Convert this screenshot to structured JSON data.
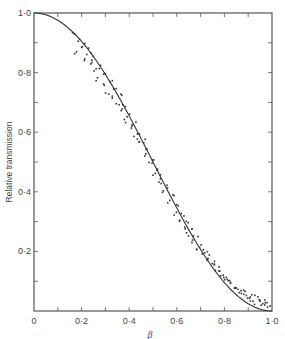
{
  "chart_data": {
    "type": "scatter",
    "title": "",
    "xlabel": "β",
    "ylabel": "Relative transmission",
    "xlim": [
      0,
      1.0
    ],
    "ylim": [
      0,
      1.0
    ],
    "grid": false,
    "legend": null,
    "x_ticks": [
      "0",
      "0·2",
      "0·4",
      "0·6",
      "0·8",
      "1·0"
    ],
    "y_ticks": [
      "0·2",
      "0·4",
      "0·6",
      "0·8",
      "1·0"
    ],
    "minor_tick_step": 0.1,
    "series": [
      {
        "name": "theory curve",
        "kind": "line",
        "description": "smooth curve ≈ cos²(πβ/2)",
        "x": [
          0,
          0.05,
          0.1,
          0.15,
          0.2,
          0.25,
          0.3,
          0.35,
          0.4,
          0.45,
          0.5,
          0.55,
          0.6,
          0.65,
          0.7,
          0.75,
          0.8,
          0.85,
          0.9,
          0.95,
          1.0
        ],
        "y": [
          1.0,
          0.994,
          0.976,
          0.946,
          0.905,
          0.854,
          0.794,
          0.727,
          0.655,
          0.578,
          0.5,
          0.422,
          0.345,
          0.273,
          0.206,
          0.146,
          0.095,
          0.054,
          0.024,
          0.006,
          0.0
        ]
      },
      {
        "name": "measured",
        "kind": "points",
        "x": [
          0.17,
          0.18,
          0.19,
          0.2,
          0.21,
          0.22,
          0.23,
          0.24,
          0.25,
          0.26,
          0.27,
          0.28,
          0.29,
          0.3,
          0.31,
          0.32,
          0.33,
          0.34,
          0.35,
          0.36,
          0.37,
          0.38,
          0.39,
          0.4,
          0.41,
          0.42,
          0.43,
          0.44,
          0.45,
          0.46,
          0.47,
          0.48,
          0.49,
          0.5,
          0.51,
          0.52,
          0.53,
          0.54,
          0.55,
          0.56,
          0.57,
          0.58,
          0.59,
          0.6,
          0.61,
          0.62,
          0.63,
          0.64,
          0.65,
          0.66,
          0.67,
          0.68,
          0.69,
          0.7,
          0.71,
          0.72,
          0.73,
          0.74,
          0.75,
          0.76,
          0.77,
          0.78,
          0.79,
          0.8,
          0.81,
          0.82,
          0.83,
          0.84,
          0.85,
          0.86,
          0.87,
          0.88,
          0.89,
          0.9,
          0.91,
          0.92,
          0.93,
          0.94,
          0.95,
          0.96,
          0.97,
          0.98,
          0.99
        ],
        "y": [
          0.93,
          0.87,
          0.91,
          0.88,
          0.84,
          0.89,
          0.86,
          0.83,
          0.85,
          0.81,
          0.78,
          0.82,
          0.76,
          0.79,
          0.73,
          0.77,
          0.72,
          0.74,
          0.7,
          0.73,
          0.67,
          0.69,
          0.64,
          0.66,
          0.62,
          0.63,
          0.58,
          0.6,
          0.56,
          0.57,
          0.52,
          0.54,
          0.49,
          0.5,
          0.46,
          0.48,
          0.43,
          0.45,
          0.4,
          0.42,
          0.37,
          0.39,
          0.33,
          0.36,
          0.31,
          0.32,
          0.28,
          0.3,
          0.26,
          0.27,
          0.23,
          0.25,
          0.21,
          0.22,
          0.19,
          0.2,
          0.17,
          0.18,
          0.16,
          0.15,
          0.14,
          0.13,
          0.12,
          0.12,
          0.1,
          0.11,
          0.09,
          0.08,
          0.08,
          0.07,
          0.06,
          0.07,
          0.05,
          0.05,
          0.04,
          0.05,
          0.03,
          0.04,
          0.03,
          0.02,
          0.03,
          0.02,
          0.01
        ]
      }
    ]
  },
  "colors": {
    "ink": "#333333",
    "axis": "#555555",
    "background": "#ffffff"
  }
}
